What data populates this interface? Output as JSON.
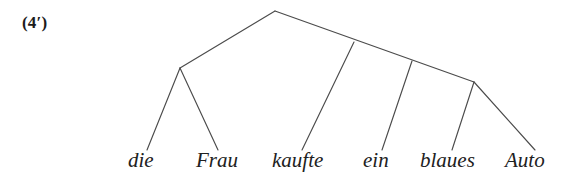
{
  "figure": {
    "example_label": "(4′)",
    "background_color": "#ffffff",
    "line_color": "#4b4b4b",
    "text_color": "#212121"
  },
  "diagram": {
    "type": "constituency-tree",
    "language": "German",
    "sentence": "die Frau kaufte ein blaues Auto",
    "nodes": [
      {
        "id": "root",
        "name": "root-node",
        "x": 275,
        "y": 11
      },
      {
        "id": "np",
        "name": "left-subject-node",
        "x": 180,
        "y": 68
      },
      {
        "id": "vp",
        "name": "right-spine-node-1",
        "x": 354,
        "y": 42
      },
      {
        "id": "obj",
        "name": "right-spine-node-2",
        "x": 412,
        "y": 61
      },
      {
        "id": "ap",
        "name": "right-spine-node-3",
        "x": 474,
        "y": 82
      }
    ],
    "edges": [
      {
        "name": "edge-root-to-left-node",
        "x1": 275,
        "y1": 11,
        "x2": 180,
        "y2": 68
      },
      {
        "name": "edge-root-to-right-spine",
        "x1": 275,
        "y1": 11,
        "x2": 474,
        "y2": 82
      },
      {
        "name": "edge-leaf-die",
        "x1": 180,
        "y1": 68,
        "x2": 147,
        "y2": 150
      },
      {
        "name": "edge-leaf-frau",
        "x1": 180,
        "y1": 68,
        "x2": 218,
        "y2": 150
      },
      {
        "name": "edge-leaf-kaufte",
        "x1": 354,
        "y1": 42,
        "x2": 302,
        "y2": 150
      },
      {
        "name": "edge-leaf-ein",
        "x1": 412,
        "y1": 61,
        "x2": 382,
        "y2": 150
      },
      {
        "name": "edge-leaf-blaues",
        "x1": 474,
        "y1": 82,
        "x2": 452,
        "y2": 150
      },
      {
        "name": "edge-leaf-auto",
        "x1": 474,
        "y1": 82,
        "x2": 535,
        "y2": 150
      }
    ],
    "terminals": [
      {
        "name": "terminal-die",
        "text": "die",
        "x": 128
      },
      {
        "name": "terminal-frau",
        "text": "Frau",
        "x": 196
      },
      {
        "name": "terminal-kaufte",
        "text": "kaufte",
        "x": 272
      },
      {
        "name": "terminal-ein",
        "text": "ein",
        "x": 363
      },
      {
        "name": "terminal-blaues",
        "text": "blaues",
        "x": 420
      },
      {
        "name": "terminal-auto",
        "text": "Auto",
        "x": 505
      }
    ]
  }
}
